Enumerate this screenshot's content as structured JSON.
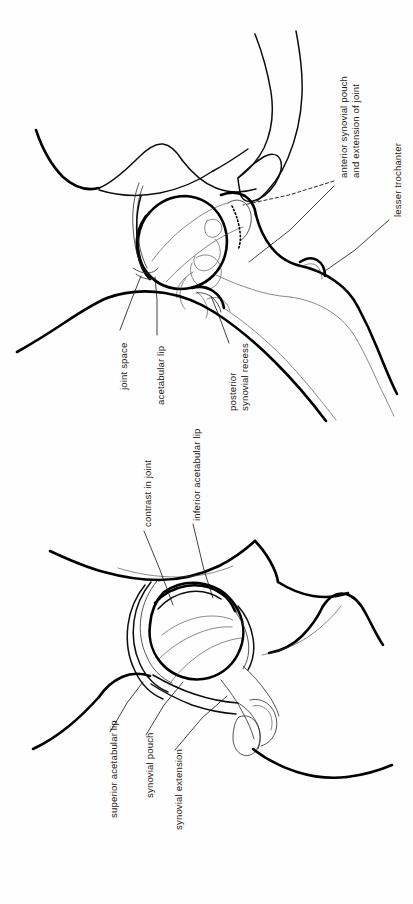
{
  "document": {
    "kind": "anatomical-line-drawing",
    "subject": "hip joint arthrogram diagram",
    "orientation": "labels rotated 90 degrees counter-clockwise",
    "background_color": "#fefefe",
    "ink_color": "#000000",
    "figure_count": 2
  },
  "figures": [
    {
      "id": "upper-figure",
      "name": "lateral hip arthrogram",
      "labels": [
        "anterior-synovial-pouch",
        "lesser-trochanter",
        "joint-space",
        "acetabular-lip",
        "posterior-synovial-recess"
      ]
    },
    {
      "id": "lower-figure",
      "name": "frontal hip arthrogram",
      "labels": [
        "contrast-in-joint",
        "inferior-acetabular-lip",
        "superior-acetabular-lip",
        "synovial-pouch",
        "synovial-extension"
      ]
    }
  ],
  "labels": {
    "anterior_synovial_pouch_line1": "anterior synovial pouch",
    "anterior_synovial_pouch_line2": "and extension of joint",
    "lesser_trochanter": "lesser trochanter",
    "joint_space": "joint space",
    "acetabular_lip": "acetabular lip",
    "posterior_line1": "posterior",
    "posterior_line2": "synovial recess",
    "contrast_in_joint": "contrast in joint",
    "inferior_acetabular_lip": "inferior acetabular lip",
    "superior_acetabular_lip": "superior acetabular lip",
    "synovial_pouch": "synovial pouch",
    "synovial_extension": "synovial extension"
  },
  "colors": {
    "ink": "#000000",
    "ink_light": "#2a2a2a",
    "paper": "#fefefe",
    "text": "#1a1a1a"
  }
}
